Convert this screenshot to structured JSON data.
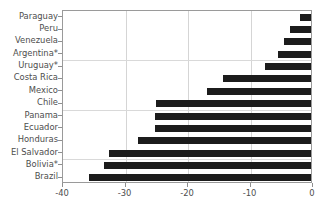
{
  "chart_data": {
    "type": "bar",
    "orientation": "horizontal",
    "title": "",
    "xlabel": "",
    "ylabel": "",
    "xlim": [
      -40,
      0
    ],
    "ylim": null,
    "grid": true,
    "legend": null,
    "xticks": [
      "-40",
      "-30",
      "-20",
      "-10",
      "0"
    ],
    "xtick_values": [
      -40,
      -30,
      -20,
      -10,
      0
    ],
    "categories": [
      "Paraguay",
      "Peru",
      "Venezuela",
      "Argentina*",
      "Uruguay*",
      "Costa Rica",
      "Mexico",
      "Chile",
      "Panama",
      "Ecuador",
      "Honduras",
      "El Salvador",
      "Bolivia*",
      "Brazil"
    ],
    "values": [
      -2.1,
      -3.7,
      -4.6,
      -5.6,
      -7.7,
      -14.4,
      -17.0,
      -25.1,
      -25.3,
      -25.3,
      -28.0,
      -32.6,
      -33.4,
      -35.8
    ],
    "bar_color": "#1c1c1c",
    "plot_border_color": "#9a9a9a",
    "gridline_color": "#d5d5d5",
    "background_color": "#ffffff"
  }
}
